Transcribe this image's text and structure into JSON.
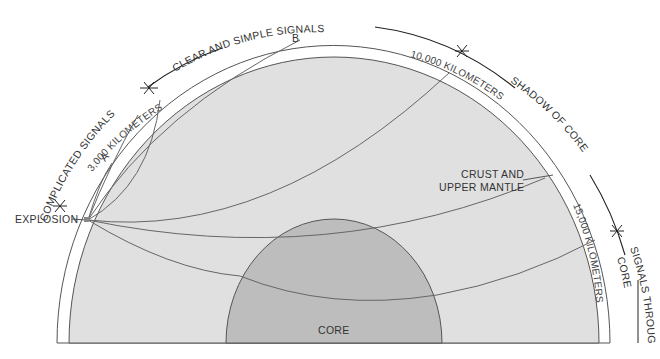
{
  "diagram": {
    "colors": {
      "background": "#ffffff",
      "mantle": "#e0e0e0",
      "core": "#bdbdbd",
      "lines": "#666666",
      "text": "#333333"
    },
    "regions": {
      "core_label": "CORE",
      "crust_label_line1": "CRUST AND",
      "crust_label_line2": "UPPER MANTLE"
    },
    "source": {
      "label": "EXPLOSION"
    },
    "stations": {
      "a": "A",
      "b": "B"
    },
    "distances": {
      "d3000": "3,000 KILOMETERS",
      "d10000": "10,000 KILOMETERS",
      "d15000": "15,000 KILOMETERS"
    },
    "zones": {
      "complicated": "COMPLICATED SIGNALS",
      "clear": "CLEAR AND SIMPLE SIGNALS",
      "shadow": "SHADOW OF CORE",
      "through_core_line1": "SIGNALS THROUGH",
      "through_core_line2": "CORE"
    }
  }
}
